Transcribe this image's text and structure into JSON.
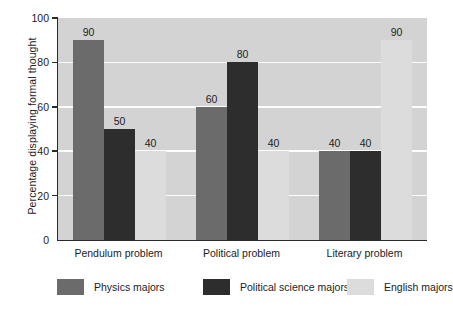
{
  "chart_data": {
    "type": "bar",
    "title": "",
    "subtitle": "",
    "xlabel": "",
    "ylabel": "Percentage displaying formal thought",
    "ylim": [
      0,
      100
    ],
    "yticks": [
      0,
      20,
      40,
      60,
      80,
      100
    ],
    "ytick_labels": [
      "0",
      "20",
      "40",
      "60",
      "80",
      "100"
    ],
    "grid": "horizontal-white-gridlines",
    "legend_position": "bottom",
    "categories": [
      "Pendulum problem",
      "Political problem",
      "Literary problem"
    ],
    "series": [
      {
        "name": "Physics majors",
        "color": "#6b6b6b",
        "values": [
          90,
          60,
          40
        ],
        "labels": [
          "90",
          "60",
          "40"
        ]
      },
      {
        "name": "Political science majors",
        "color": "#2d2d2d",
        "values": [
          50,
          80,
          40
        ],
        "labels": [
          "50",
          "80",
          "40"
        ]
      },
      {
        "name": "English majors",
        "color": "#dcdcdc",
        "values": [
          40,
          40,
          90
        ],
        "labels": [
          "40",
          "40",
          "90"
        ]
      }
    ],
    "plot_background": "#d3d3d3",
    "figure_background": "#ffffff",
    "gridline_color": "#fdfdfd",
    "axis_color": "#2a2a2a"
  }
}
